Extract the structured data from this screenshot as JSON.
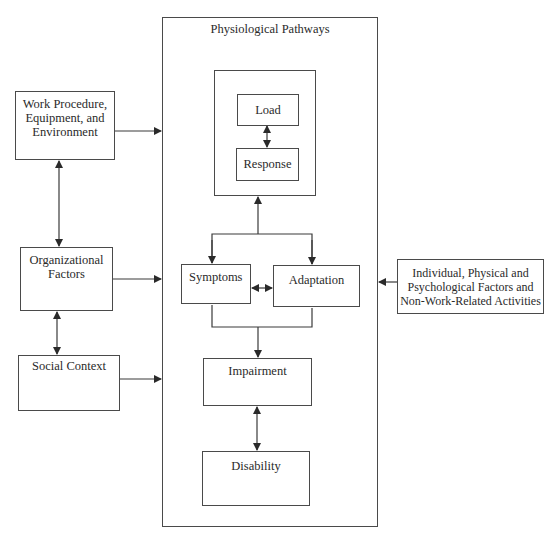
{
  "diagram": {
    "outer_box": {
      "title": "Physiological Pathways"
    },
    "inner_nodes": {
      "load": "Load",
      "response": "Response",
      "symptoms": "Symptoms",
      "adaptation": "Adaptation",
      "impairment": "Impairment",
      "disability": "Disability"
    },
    "left_nodes": {
      "work": [
        "Work Procedure,",
        "Equipment, and",
        "Environment"
      ],
      "organizational": [
        "Organizational",
        "Factors"
      ],
      "social": [
        "Social Context"
      ]
    },
    "right_nodes": {
      "individual": [
        "Individual, Physical and",
        "Psychological Factors and",
        "Non-Work-Related Activities"
      ]
    },
    "connections": [
      {
        "from": "Work Procedure, Equipment, and Environment",
        "to": "Physiological Pathways",
        "type": "arrow"
      },
      {
        "from": "Organizational Factors",
        "to": "Physiological Pathways",
        "type": "arrow"
      },
      {
        "from": "Social Context",
        "to": "Physiological Pathways",
        "type": "arrow"
      },
      {
        "from": "Individual, Physical and Psychological Factors and Non-Work-Related Activities",
        "to": "Physiological Pathways",
        "type": "arrow"
      },
      {
        "from": "Work Procedure, Equipment, and Environment",
        "to": "Organizational Factors",
        "type": "bidirectional"
      },
      {
        "from": "Organizational Factors",
        "to": "Social Context",
        "type": "bidirectional"
      },
      {
        "from": "Load",
        "to": "Response",
        "type": "bidirectional"
      },
      {
        "from": "Symptoms/Adaptation",
        "to": "Load-Response",
        "type": "arrow"
      },
      {
        "from": "Load-Response",
        "to": "Symptoms",
        "type": "arrow"
      },
      {
        "from": "Load-Response",
        "to": "Adaptation",
        "type": "arrow"
      },
      {
        "from": "Symptoms",
        "to": "Adaptation",
        "type": "bidirectional"
      },
      {
        "from": "Symptoms/Adaptation",
        "to": "Impairment",
        "type": "arrow"
      },
      {
        "from": "Impairment",
        "to": "Disability",
        "type": "bidirectional"
      }
    ]
  }
}
